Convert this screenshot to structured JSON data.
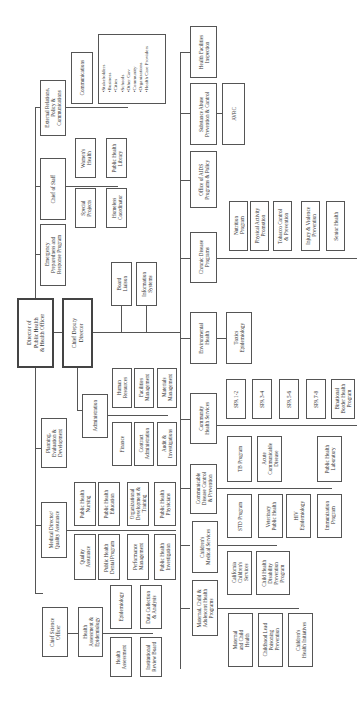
{
  "chart_title": "",
  "orientation": "rotated-90-ccw",
  "nodes": {
    "director": "Director of\nPublic Health\n& Health Officer",
    "chief_deputy": "Chief Deputy\nDirector",
    "emergency": "Emergency\nPreparedness and\nResponse Program",
    "chief_of_staff": "Chief of Staff",
    "external_relations": "External Relations,\nPolicy &\nCommunications",
    "communications": "Communications",
    "stakeholders": [
      "Stakeholders",
      "Business",
      "Cities",
      "Schools",
      "Other Gov",
      "Community",
      "Organizations",
      "Health Care Providers"
    ],
    "womens_health": "Women's\nHealth",
    "ph_library": "Public Health\nLibrary",
    "special_projects": "Special\nProjects",
    "homeless": "Homeless\nCoordinator",
    "board_liaison": "Board\nLiaison",
    "info_systems": "Information\nSystems",
    "administration": "Administration",
    "human_resources": "Human\nResources",
    "facilities": "Facilities\nManagement",
    "materials": "Materials\nManagement",
    "finance": "Finance",
    "contract_admin": "Contract\nAdministration",
    "audit": "Audit &\nInvestigations",
    "planning": "Planning,\nEvaluation &\nDevelopment",
    "medical_director": "Medical Director/\nQuality Assurance",
    "ph_nursing": "Public Health\nNursing",
    "ph_education": "Public Health\nEducation",
    "org_dev": "Organizational\nDevelopment &\nTraining",
    "ph_physicians": "Public Health\nPhysicians",
    "quality_assurance": "Quality\nAssurance",
    "ph_dental": "Public Health\nDental Program",
    "performance": "Performance\nManagement",
    "ph_investigation": "Public Health\nInvestigation",
    "chief_science": "Chief Science\nOfficer",
    "health_assessment_epi": "Health\nAssessment &\nEpidemiology",
    "epidemiology": "Epidemiology",
    "data_collection": "Data Collection\n& Analysis",
    "health_assessment": "Health\nAssessment",
    "irb": "Institutional\nReview Board",
    "health_facilities": "Health Facilities\nInspection",
    "substance_abuse": "Substance Abuse\nPrevention & Control",
    "avrc": "AVRC",
    "aids": "Office of AIDS\nPrograms & Policy",
    "chronic_disease": "Chronic Disease\nPrograms",
    "nutrition": "Nutrition\nProgram",
    "physical_activity": "Physical Activity\nPromotion",
    "tobacco": "Tobacco Control\n& Prevention",
    "injury": "Injury & Violence\nPrevention",
    "senior_health": "Senior Health",
    "environmental": "Environmental\nHealth",
    "toxics": "Toxics\nEpidemiology",
    "community_health": "Community\nHealth Services",
    "spa12": "SPA 1-2",
    "spa34": "SPA 3-4",
    "spa56": "SPA 5-6",
    "spa78": "SPA 7-8",
    "binational": "Binational\nBorder Health\nProgram",
    "communicable": "Communicable\nDisease Control\n& Prevention",
    "tb": "TB Program",
    "acute": "Acute\nCommunicable\nDisease",
    "ph_lab": "Public Health\nLaboratory",
    "std": "STD Program",
    "veterinary": "Veterinary\nPublic Health",
    "hiv": "HIV\nEpidemiology",
    "immunization": "Immunization\nProgram",
    "childrens_medical": "Children's\nMedical Services",
    "ccs": "California\nChildren's\nServices",
    "chdp": "Child Health\nDisability\nPrevention\nProgram",
    "mcah": "Maternal, Child &\nAdolescent Health\nPrograms",
    "maternal_child": "Maternal\nand Child\nHealth",
    "lead": "Childhood Lead\nPoisoning\nPrevention",
    "childrens_initiatives": "Children's\nHealth Initiatives"
  },
  "colors": {
    "line": "#555555",
    "text": "#333333",
    "background": "#ffffff"
  }
}
